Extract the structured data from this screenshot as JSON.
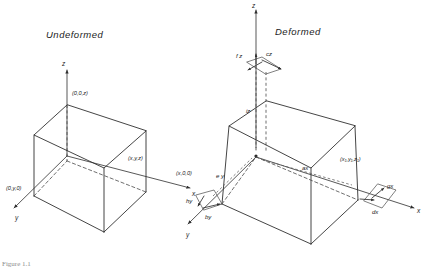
{
  "figure": {
    "caption": "Figure 1.1"
  },
  "panels": [
    {
      "id": "undeformed",
      "title": "Undeformed",
      "axes": {
        "z_label": "z",
        "x_label": "x",
        "y_label": "y"
      },
      "vertex_labels": [
        {
          "name": "origin-top",
          "text": "(0,0,z)"
        },
        {
          "name": "front-right-top",
          "text": "(x,y,z)"
        },
        {
          "name": "x-axis-corner",
          "text": "(x,0,0)"
        },
        {
          "name": "y-axis-corner",
          "text": "(0,y,0)"
        }
      ]
    },
    {
      "id": "deformed",
      "title": "Deformed",
      "axes": {
        "z_label": "z",
        "x_label": "x",
        "y_label": "y"
      },
      "vertex_labels": [
        {
          "name": "front-right-top",
          "text": "(x₁,y₁,z₁)"
        }
      ],
      "annotations": [
        {
          "name": "fz",
          "text": "f z"
        },
        {
          "name": "cz",
          "text": "cz"
        },
        {
          "name": "iz",
          "text": "iz"
        },
        {
          "name": "ey",
          "text": "e y"
        },
        {
          "name": "ax",
          "text": "ax"
        },
        {
          "name": "gx",
          "text": "gx"
        },
        {
          "name": "dx",
          "text": "dx"
        },
        {
          "name": "hy",
          "text": "hy"
        },
        {
          "name": "by",
          "text": "by"
        }
      ]
    }
  ],
  "colors": {
    "stroke": "#303030",
    "hidden_stroke": "#4a4a4a",
    "text": "#1c1c1c",
    "background": "#ffffff"
  }
}
